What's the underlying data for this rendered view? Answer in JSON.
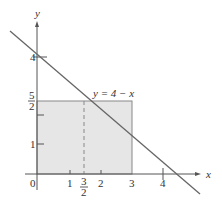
{
  "figure": {
    "axes": {
      "x_label": "x",
      "y_label": "y",
      "origin_label": "0",
      "x_ticks": [
        {
          "label": "1",
          "value": 1
        },
        {
          "label": "2",
          "value": 2
        },
        {
          "label": "3",
          "value": 3
        },
        {
          "label": "4",
          "value": 4
        }
      ],
      "x_frac_tick": {
        "num": "3",
        "den": "2",
        "value": 1.5
      },
      "y_ticks": [
        {
          "label": "1",
          "value": 1
        },
        {
          "label": "4",
          "value": 4
        }
      ],
      "y_frac_tick": {
        "num": "5",
        "den": "2",
        "value": 2.5
      }
    },
    "line": {
      "label": "y = 4 − x",
      "equation": "y = 4 - x"
    },
    "rectangle": {
      "x0": 0,
      "y0": 0,
      "x1": 3,
      "y1": 2.5,
      "fill": "#e6e6e6"
    },
    "dashed_line": {
      "x": 1.5,
      "y_top": 2.5
    },
    "colors": {
      "line": "#666666",
      "axis": "#555555",
      "fill": "#e6e6e6"
    }
  }
}
